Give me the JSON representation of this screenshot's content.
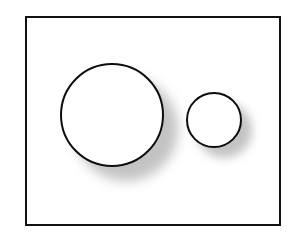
{
  "figure": {
    "background_color": "#ffffff",
    "canvas": {
      "width": 298,
      "height": 239
    },
    "frame": {
      "name": "outer-rectangle-border",
      "x": 25,
      "y": 16,
      "width": 256,
      "height": 210,
      "stroke_color": "#111111",
      "stroke_width": 2,
      "fill_color": "#ffffff"
    },
    "shapes": [
      {
        "id": "large-circle",
        "label": "Large circle",
        "type": "circle",
        "center_x": 112,
        "center_y": 115,
        "diameter": 104,
        "radius": 52,
        "fill_color": "#ffffff",
        "stroke_color": "#0d0d0d",
        "stroke_width": 2,
        "shadow": {
          "color": "#b9b9b9",
          "offset_x": 14,
          "offset_y": 14,
          "blur": 6,
          "diameter": 104
        }
      },
      {
        "id": "small-circle",
        "label": "Small circle",
        "type": "circle",
        "center_x": 214,
        "center_y": 120,
        "diameter": 56,
        "radius": 28,
        "fill_color": "#ffffff",
        "stroke_color": "#0d0d0d",
        "stroke_width": 2,
        "shadow": {
          "color": "#b9b9b9",
          "offset_x": 10,
          "offset_y": 10,
          "blur": 5,
          "diameter": 56
        }
      }
    ],
    "annotations": []
  }
}
